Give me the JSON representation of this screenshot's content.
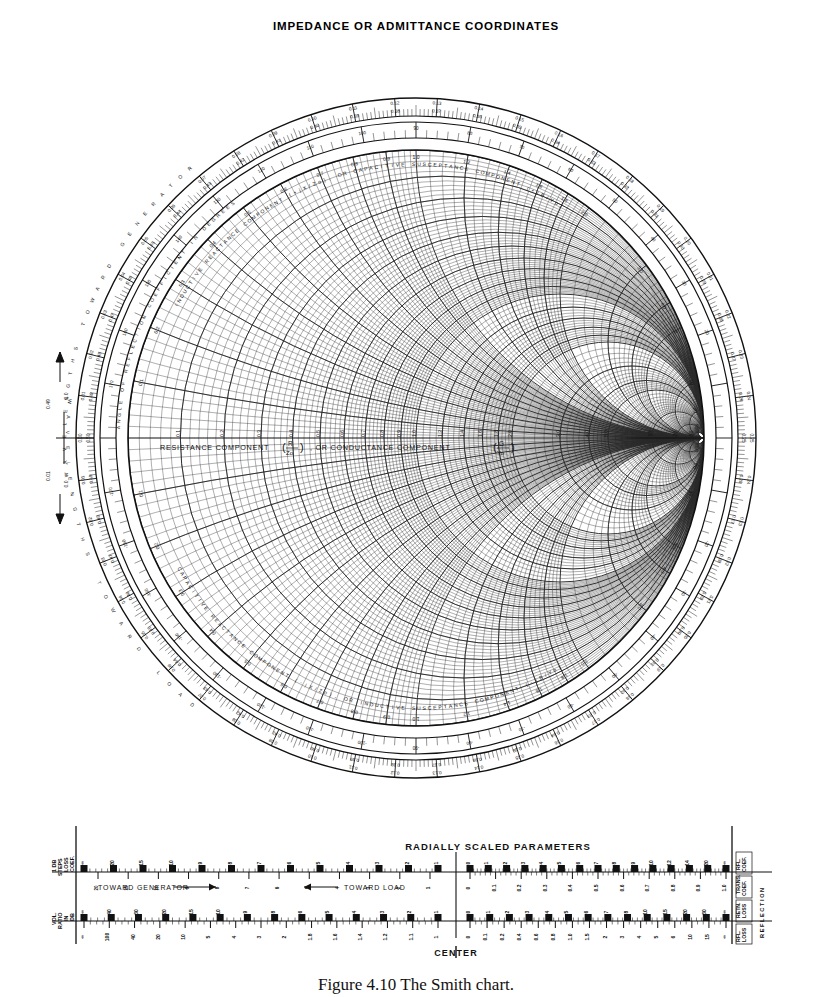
{
  "page": {
    "title": "IMPEDANCE OR ADMITTANCE COORDINATES",
    "caption": "Figure 4.10  The Smith chart."
  },
  "chart": {
    "type": "smith-chart",
    "center_axis_label_part1": "RESISTANCE COMPONENT",
    "center_axis_label_frac1_num": "R",
    "center_axis_label_frac1_den": "Zo",
    "center_axis_label_mid": ", OR CONDUCTANCE COMPONENT",
    "center_axis_label_frac2_num": "G",
    "center_axis_label_frac2_den": "Yo",
    "upper_arc_label": "INDUCTIVE REACTANCE COMPONENT (+jX/Zo), OR CAPACITIVE SUSCEPTANCE COMPONENT (+jB/Yo)",
    "lower_arc_label": "CAPACITIVE REACTANCE COMPONENT (-jX/Zo), OR INDUCTIVE SUSCEPTANCE COMPONENT (-jB/Yo)",
    "outer_ring_upper_label": "WAVELENGTHS TOWARD GENERATOR",
    "outer_ring_lower_label": "WAVELENGTHS TOWARD LOAD",
    "angle_ring_label": "ANGLE OF REFLECTION COEFFICIENT IN DEGREES",
    "left_tick_upper": "0.49",
    "left_tick_lower": "0.01",
    "left_mark_upper": "0.0",
    "left_mark_lower": "0.0",
    "resistance_circles": [
      0.1,
      0.2,
      0.3,
      0.4,
      0.5,
      0.6,
      0.7,
      0.8,
      0.9,
      1.0,
      1.2,
      1.4,
      1.6,
      1.8,
      2.0,
      3.0,
      4.0,
      5.0,
      10.0,
      20.0,
      50.0
    ],
    "resistance_labels": [
      "0.1",
      "0.2",
      "0.3",
      "0.4",
      "0.5",
      "0.6",
      "0.7",
      "0.8",
      "0.9",
      "1.0",
      "1.2",
      "1.4",
      "1.6",
      "1.8",
      "2.0",
      "3.0",
      "4.0",
      "5.0",
      "10",
      "20",
      "50"
    ],
    "reactance_arcs": [
      0.1,
      0.2,
      0.3,
      0.4,
      0.5,
      0.6,
      0.7,
      0.8,
      0.9,
      1.0,
      1.2,
      1.4,
      1.6,
      1.8,
      2.0,
      3.0,
      4.0,
      5.0,
      10.0,
      20.0,
      50.0
    ],
    "reactance_labels": [
      "0.1",
      "0.2",
      "0.3",
      "0.4",
      "0.5",
      "0.6",
      "0.7",
      "0.8",
      "0.9",
      "1.0",
      "1.2",
      "1.4",
      "1.6",
      "1.8",
      "2.0",
      "3.0",
      "4.0",
      "5.0",
      "10",
      "20",
      "50"
    ],
    "wavelength_pairs": [
      {
        "toward_generator": "0.00",
        "toward_load": "0.50"
      },
      {
        "toward_generator": "0.01",
        "toward_load": "0.49"
      },
      {
        "toward_generator": "0.02",
        "toward_load": "0.48"
      },
      {
        "toward_generator": "0.03",
        "toward_load": "0.47"
      },
      {
        "toward_generator": "0.04",
        "toward_load": "0.46"
      },
      {
        "toward_generator": "0.05",
        "toward_load": "0.45"
      },
      {
        "toward_generator": "0.06",
        "toward_load": "0.44"
      },
      {
        "toward_generator": "0.07",
        "toward_load": "0.43"
      },
      {
        "toward_generator": "0.08",
        "toward_load": "0.42"
      },
      {
        "toward_generator": "0.09",
        "toward_load": "0.41"
      },
      {
        "toward_generator": "0.10",
        "toward_load": "0.40"
      },
      {
        "toward_generator": "0.11",
        "toward_load": "0.39"
      },
      {
        "toward_generator": "0.12",
        "toward_load": "0.38"
      },
      {
        "toward_generator": "0.13",
        "toward_load": "0.37"
      },
      {
        "toward_generator": "0.14",
        "toward_load": "0.36"
      },
      {
        "toward_generator": "0.15",
        "toward_load": "0.35"
      },
      {
        "toward_generator": "0.16",
        "toward_load": "0.34"
      },
      {
        "toward_generator": "0.17",
        "toward_load": "0.33"
      },
      {
        "toward_generator": "0.18",
        "toward_load": "0.32"
      },
      {
        "toward_generator": "0.19",
        "toward_load": "0.31"
      },
      {
        "toward_generator": "0.20",
        "toward_load": "0.30"
      },
      {
        "toward_generator": "0.21",
        "toward_load": "0.29"
      },
      {
        "toward_generator": "0.22",
        "toward_load": "0.28"
      },
      {
        "toward_generator": "0.23",
        "toward_load": "0.27"
      },
      {
        "toward_generator": "0.24",
        "toward_load": "0.26"
      },
      {
        "toward_generator": "0.25",
        "toward_load": "0.25"
      }
    ],
    "angle_labels": [
      "20",
      "30",
      "40",
      "50",
      "60",
      "70",
      "80",
      "90",
      "100",
      "110",
      "120",
      "130",
      "140",
      "150",
      "160",
      "170",
      "-20",
      "-30",
      "-40",
      "-50",
      "-60",
      "-70",
      "-80",
      "-90",
      "-100",
      "-110",
      "-120",
      "-130",
      "-140",
      "-150",
      "-160",
      "-170"
    ]
  },
  "rsp": {
    "heading": "RADIALLY SCALED PARAMETERS",
    "center_label": "CENTER",
    "toward_generator": "TOWARD GENERATOR",
    "toward_load": "TOWARD LOAD",
    "arrow_right": "⟶",
    "arrow_left": "⟵",
    "left_row1_labels": [
      "LOSS",
      "COEF.",
      "1 DB",
      "STEPS"
    ],
    "left_row2_labels": [
      "IN",
      "DB",
      "VOL.",
      "RATIO"
    ],
    "right_stack_labels": [
      "RFL.",
      "COEF.",
      "TRANS.",
      "COEF.",
      "RETN.",
      "LOSS",
      "RFL.",
      "LOSS"
    ],
    "right_side_label": "REFLECTION",
    "right_side_sub1": "LOSS IN DB",
    "row1_left_ticks": [
      "∞",
      "20",
      "15",
      "10",
      "9",
      "8",
      "7",
      "6",
      "5",
      "4",
      "3",
      "2",
      "1"
    ],
    "row1_right_ticks": [
      "0",
      "1",
      "2",
      "3",
      "4",
      "5",
      "6",
      "7",
      "8",
      "9",
      "10",
      "12",
      "14",
      "20",
      "∞"
    ],
    "row2_left_ticks": [
      "∞",
      "100",
      "40",
      "20",
      "10",
      "5",
      "4",
      "3",
      "2",
      "1.8",
      "1.6",
      "1.4",
      "1.2",
      "1.1",
      "1"
    ],
    "row2_right_ticks": [
      "0",
      "0.1",
      "0.2",
      "0.3",
      "0.4",
      "0.5",
      "0.6",
      "0.7",
      "0.8",
      "0.9",
      "1.0"
    ],
    "swr_db_top": [
      "∞",
      "40",
      "30",
      "20",
      "15",
      "10",
      "9",
      "8",
      "6",
      "5",
      "4",
      "3",
      "2",
      "1"
    ],
    "trans_coef_ticks": [
      "0",
      "0.1",
      "0.2",
      "0.3",
      "0.4",
      "0.5",
      "0.6",
      "0.7",
      "0.8",
      "0.9",
      "1.0"
    ],
    "retn_loss_ticks": [
      "0",
      "1",
      "2",
      "3",
      "4",
      "5",
      "6",
      "7",
      "8",
      "10",
      "15",
      "20",
      "30",
      "∞"
    ],
    "rfl_coef_ticks": [
      "0",
      "0.1",
      "0.2",
      "0.3",
      "0.4",
      "0.5",
      "0.6",
      "0.7",
      "0.8",
      "0.9",
      "1.0"
    ],
    "rfl_loss_ticks": [
      "0",
      "0.1",
      "0.2",
      "0.4",
      "0.6",
      "0.8",
      "1.0",
      "1.5",
      "2",
      "3",
      "4",
      "5",
      "6",
      "10",
      "15",
      "∞"
    ]
  }
}
